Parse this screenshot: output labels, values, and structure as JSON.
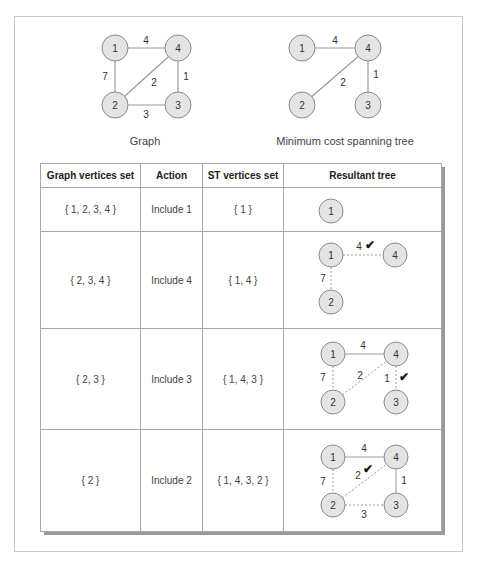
{
  "top": {
    "graph_caption": "Graph",
    "mst_caption": "Minimum cost spanning tree",
    "graph": {
      "nodes": [
        "1",
        "2",
        "3",
        "4"
      ],
      "edges": [
        {
          "from": "1",
          "to": "4",
          "weight": "4"
        },
        {
          "from": "1",
          "to": "2",
          "weight": "7"
        },
        {
          "from": "2",
          "to": "4",
          "weight": "2"
        },
        {
          "from": "4",
          "to": "3",
          "weight": "1"
        },
        {
          "from": "2",
          "to": "3",
          "weight": "3"
        }
      ]
    },
    "mst": {
      "nodes": [
        "1",
        "2",
        "3",
        "4"
      ],
      "edges": [
        {
          "from": "1",
          "to": "4",
          "weight": "4"
        },
        {
          "from": "2",
          "to": "4",
          "weight": "2"
        },
        {
          "from": "4",
          "to": "3",
          "weight": "1"
        }
      ]
    }
  },
  "table": {
    "headers": [
      "Graph vertices set",
      "Action",
      "ST vertices set",
      "Resultant tree"
    ],
    "rows": [
      {
        "graph_set": "{ 1, 2, 3, 4 }",
        "action": "Include 1",
        "st_set": "{ 1 }",
        "tree": {
          "nodes": [
            "1"
          ],
          "edges": []
        }
      },
      {
        "graph_set": "{ 2, 3, 4 }",
        "action": "Include 4",
        "st_set": "{ 1, 4 }",
        "tree": {
          "nodes": [
            "1",
            "4",
            "2"
          ],
          "edges": [
            {
              "from": "1",
              "to": "4",
              "weight": "4",
              "style": "dotted",
              "selected": true
            },
            {
              "from": "1",
              "to": "2",
              "weight": "7",
              "style": "dotted"
            }
          ]
        }
      },
      {
        "graph_set": "{ 2, 3 }",
        "action": "Include 3",
        "st_set": "{ 1, 4, 3 }",
        "tree": {
          "nodes": [
            "1",
            "4",
            "2",
            "3"
          ],
          "edges": [
            {
              "from": "1",
              "to": "4",
              "weight": "4",
              "style": "solid"
            },
            {
              "from": "1",
              "to": "2",
              "weight": "7",
              "style": "dotted"
            },
            {
              "from": "2",
              "to": "4",
              "weight": "2",
              "style": "dotted"
            },
            {
              "from": "4",
              "to": "3",
              "weight": "1",
              "style": "dotted",
              "selected": true
            }
          ]
        }
      },
      {
        "graph_set": "{ 2 }",
        "action": "Include 2",
        "st_set": "{ 1, 4, 3, 2 }",
        "tree": {
          "nodes": [
            "1",
            "4",
            "2",
            "3"
          ],
          "edges": [
            {
              "from": "1",
              "to": "4",
              "weight": "4",
              "style": "solid"
            },
            {
              "from": "4",
              "to": "3",
              "weight": "1",
              "style": "solid"
            },
            {
              "from": "1",
              "to": "2",
              "weight": "7",
              "style": "dotted"
            },
            {
              "from": "2",
              "to": "4",
              "weight": "2",
              "style": "dotted",
              "selected": true
            },
            {
              "from": "2",
              "to": "3",
              "weight": "3",
              "style": "dotted"
            }
          ]
        }
      }
    ],
    "check_mark": "✔"
  },
  "colors": {
    "node_fill": "#e4e4e4",
    "node_stroke": "#8a8a8a",
    "edge": "#9a9a9a",
    "border": "#a8a8a8",
    "shadow": "#9a9a9a"
  }
}
